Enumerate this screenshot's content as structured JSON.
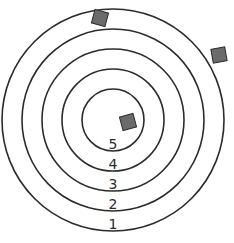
{
  "diagram": {
    "type": "concentric-target",
    "center": [
      113,
      120
    ],
    "rings": [
      {
        "score": "1",
        "radius": 111,
        "label_y": 229
      },
      {
        "score": "2",
        "radius": 91,
        "label_y": 209
      },
      {
        "score": "3",
        "radius": 71,
        "label_y": 189
      },
      {
        "score": "4",
        "radius": 51,
        "label_y": 169
      },
      {
        "score": "5",
        "radius": 31,
        "label_y": 149
      }
    ],
    "markers": [
      {
        "name": "marker-top",
        "x": 100,
        "y": 18,
        "size": 14,
        "rotate": 15
      },
      {
        "name": "marker-right",
        "x": 219,
        "y": 55,
        "size": 14,
        "rotate": -10
      },
      {
        "name": "marker-center",
        "x": 128,
        "y": 122,
        "size": 14,
        "rotate": -15
      }
    ],
    "colors": {
      "stroke": "#2b2b2b",
      "marker_fill": "#6b6b6b",
      "background": "#ffffff"
    }
  }
}
